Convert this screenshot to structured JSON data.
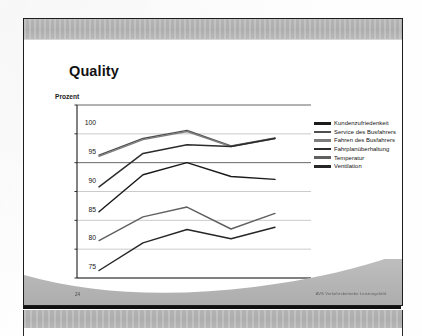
{
  "slide": {
    "title": "Quality",
    "footer_page": "24",
    "footer_right": "AVS Verkehrsbetriebe Leistungsfeld"
  },
  "chart_data": {
    "type": "line",
    "title": "Quality",
    "xlabel": "",
    "ylabel": "Prozent",
    "ylim": [
      70,
      100
    ],
    "yticks": [
      70,
      75,
      80,
      85,
      90,
      95,
      100
    ],
    "grid": true,
    "legend_position": "right",
    "categories": [
      "2000",
      "2001",
      "2002",
      "2003",
      "2004"
    ],
    "series": [
      {
        "name": "Kundenzufriedenkeit",
        "color": "#1a1a1a",
        "values": [
          81.5,
          87.9,
          90.0,
          87.6,
          87.1
        ]
      },
      {
        "name": "Service des Busfahrers",
        "color": "#4f4f4f",
        "values": [
          91.3,
          94.2,
          95.6,
          92.9,
          94.3
        ]
      },
      {
        "name": "Fahren des Busfahrers",
        "color": "#7d7d7d",
        "values": [
          91.1,
          94.0,
          95.4,
          92.8,
          94.2
        ]
      },
      {
        "name": "Fahrplanüberhaltung",
        "color": "#2b2b2b",
        "values": [
          85.8,
          91.6,
          93.1,
          92.8,
          94.2
        ]
      },
      {
        "name": "Temperatur",
        "color": "#606060",
        "values": [
          76.5,
          80.6,
          82.3,
          78.5,
          81.2
        ]
      },
      {
        "name": "Ventilation",
        "color": "#262626",
        "values": [
          71.3,
          76.1,
          78.4,
          76.8,
          78.8
        ]
      }
    ]
  }
}
